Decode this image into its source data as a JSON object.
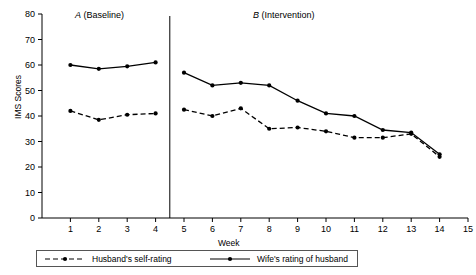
{
  "chart_data": {
    "type": "line",
    "title": "",
    "xlabel": "Week",
    "ylabel": "IMS Scores",
    "xlim": [
      0,
      15
    ],
    "ylim": [
      0,
      80
    ],
    "xticks": [
      1,
      2,
      3,
      4,
      5,
      6,
      7,
      8,
      9,
      10,
      11,
      12,
      13,
      14,
      15
    ],
    "yticks": [
      0,
      10,
      20,
      30,
      40,
      50,
      60,
      70,
      80
    ],
    "grid": false,
    "legend_position": "below-axes",
    "x": [
      1,
      2,
      3,
      4,
      5,
      6,
      7,
      8,
      9,
      10,
      11,
      12,
      13,
      14
    ],
    "series": [
      {
        "name": "Husband's self-rating",
        "style": "dashed",
        "marker": "filled-circle",
        "color": "#000000",
        "x": [
          1,
          2,
          3,
          4,
          5,
          6,
          7,
          8,
          9,
          10,
          11,
          12,
          13,
          14
        ],
        "values": [
          42,
          38.5,
          40.5,
          41,
          42.5,
          40,
          43,
          35,
          35.5,
          34,
          31.5,
          31.5,
          33,
          24
        ]
      },
      {
        "name": "Wife's rating of husband",
        "style": "solid",
        "marker": "filled-circle",
        "color": "#000000",
        "x": [
          1,
          2,
          3,
          4,
          5,
          6,
          7,
          8,
          9,
          10,
          11,
          12,
          13,
          14
        ],
        "values": [
          60,
          58.5,
          59.5,
          61,
          57,
          52,
          53,
          52,
          46,
          41,
          40,
          34.5,
          33.5,
          25
        ]
      }
    ],
    "phases": [
      {
        "id": "A",
        "label_prefix": "A",
        "label_suffix": " (Baseline)",
        "x_start": 0.4,
        "x_end": 4.5
      },
      {
        "id": "B",
        "label_prefix": "B",
        "label_suffix": " (Intervention)",
        "x_start": 4.5,
        "x_end": 15
      }
    ],
    "phase_divider_x": 4.5,
    "annotations": []
  },
  "legend": {
    "entries": [
      {
        "label": "Husband's self-rating",
        "style": "dashed"
      },
      {
        "label": "Wife's rating of husband",
        "style": "solid"
      }
    ]
  }
}
